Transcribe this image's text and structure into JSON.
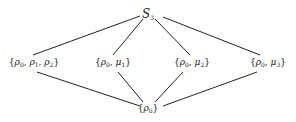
{
  "diagram": {
    "type": "hasse-diagram",
    "line_color": "#222222",
    "nodes": [
      {
        "id": "S3",
        "label": "S_3",
        "x": 148,
        "y": 14
      },
      {
        "id": "rho-group",
        "label": "{ρ0, ρ1, ρ2}",
        "x": 34,
        "y": 63
      },
      {
        "id": "mu1-group",
        "label": "{ρ0, μ1}",
        "x": 113,
        "y": 63
      },
      {
        "id": "mu2-group",
        "label": "{ρ0, μ2}",
        "x": 192,
        "y": 63
      },
      {
        "id": "mu3-group",
        "label": "{ρ0, μ3}",
        "x": 268,
        "y": 63
      },
      {
        "id": "trivial",
        "label": "{ρ0}",
        "x": 148,
        "y": 109
      }
    ],
    "edges": [
      {
        "from": "S3",
        "to": "rho-group"
      },
      {
        "from": "S3",
        "to": "mu1-group"
      },
      {
        "from": "S3",
        "to": "mu2-group"
      },
      {
        "from": "S3",
        "to": "mu3-group"
      },
      {
        "from": "rho-group",
        "to": "trivial"
      },
      {
        "from": "mu1-group",
        "to": "trivial"
      },
      {
        "from": "mu2-group",
        "to": "trivial"
      },
      {
        "from": "mu3-group",
        "to": "trivial"
      }
    ]
  },
  "labels": {
    "top": {
      "base": "S",
      "sub": "3"
    },
    "rho_group": {
      "open": "{",
      "a": "ρ",
      "a_sub": "0",
      "sep1": ", ",
      "b": "ρ",
      "b_sub": "1",
      "sep2": ", ",
      "c": "ρ",
      "c_sub": "2",
      "close": "}"
    },
    "mu1_group": {
      "open": "{",
      "a": "ρ",
      "a_sub": "0",
      "sep": ", ",
      "b": "μ",
      "b_sub": "1",
      "close": "}"
    },
    "mu2_group": {
      "open": "{",
      "a": "ρ",
      "a_sub": "0",
      "sep": ", ",
      "b": "μ",
      "b_sub": "2",
      "close": "}"
    },
    "mu3_group": {
      "open": "{",
      "a": "ρ",
      "a_sub": "0",
      "sep": ", ",
      "b": "μ",
      "b_sub": "3",
      "close": "}"
    },
    "trivial": {
      "open": "{",
      "a": "ρ",
      "a_sub": "0",
      "close": "}"
    }
  }
}
